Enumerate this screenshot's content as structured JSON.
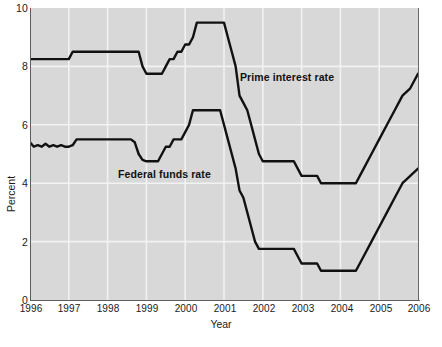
{
  "chart_data": {
    "type": "line",
    "title": "",
    "xlabel": "Year",
    "ylabel": "Percent",
    "xlim": [
      1996,
      2006
    ],
    "ylim": [
      0,
      10
    ],
    "grid": true,
    "legend_position": "inline-annotations",
    "xticks": [
      "1996",
      "1997",
      "1998",
      "1999",
      "2000",
      "2001",
      "2002",
      "2003",
      "2004",
      "2005",
      "2006"
    ],
    "yticks": [
      "0",
      "2",
      "4",
      "6",
      "8",
      "10"
    ],
    "series": [
      {
        "name": "Prime interest rate",
        "x": [
          1996.0,
          1996.1,
          1996.2,
          1996.3,
          1996.4,
          1996.5,
          1996.6,
          1996.7,
          1996.8,
          1996.9,
          1997.0,
          1997.1,
          1997.2,
          1997.3,
          1997.4,
          1997.5,
          1997.6,
          1997.7,
          1997.8,
          1997.9,
          1998.0,
          1998.1,
          1998.2,
          1998.3,
          1998.4,
          1998.5,
          1998.6,
          1998.7,
          1998.8,
          1998.9,
          1999.0,
          1999.1,
          1999.2,
          1999.3,
          1999.4,
          1999.5,
          1999.6,
          1999.7,
          1999.8,
          1999.9,
          2000.0,
          2000.1,
          2000.2,
          2000.3,
          2000.4,
          2000.5,
          2000.6,
          2000.7,
          2000.8,
          2000.9,
          2001.0,
          2001.1,
          2001.2,
          2001.3,
          2001.4,
          2001.5,
          2001.6,
          2001.7,
          2001.8,
          2001.9,
          2002.0,
          2002.2,
          2002.4,
          2002.6,
          2002.8,
          2002.9,
          2003.0,
          2003.2,
          2003.4,
          2003.5,
          2003.7,
          2003.9,
          2004.0,
          2004.2,
          2004.4,
          2004.5,
          2004.6,
          2004.8,
          2005.0,
          2005.2,
          2005.4,
          2005.6,
          2005.8,
          2006.0
        ],
        "y": [
          8.25,
          8.25,
          8.25,
          8.25,
          8.25,
          8.25,
          8.25,
          8.25,
          8.25,
          8.25,
          8.25,
          8.5,
          8.5,
          8.5,
          8.5,
          8.5,
          8.5,
          8.5,
          8.5,
          8.5,
          8.5,
          8.5,
          8.5,
          8.5,
          8.5,
          8.5,
          8.5,
          8.5,
          8.5,
          8.0,
          7.75,
          7.75,
          7.75,
          7.75,
          7.75,
          8.0,
          8.25,
          8.25,
          8.5,
          8.5,
          8.75,
          8.75,
          9.0,
          9.5,
          9.5,
          9.5,
          9.5,
          9.5,
          9.5,
          9.5,
          9.5,
          9.0,
          8.5,
          8.0,
          7.0,
          6.75,
          6.5,
          6.0,
          5.5,
          5.0,
          4.75,
          4.75,
          4.75,
          4.75,
          4.75,
          4.5,
          4.25,
          4.25,
          4.25,
          4.0,
          4.0,
          4.0,
          4.0,
          4.0,
          4.0,
          4.25,
          4.5,
          5.0,
          5.5,
          6.0,
          6.5,
          7.0,
          7.25,
          7.75
        ],
        "color": "#111111",
        "linewidth": 2.4,
        "annotation": "Prime interest rate"
      },
      {
        "name": "Federal funds rate",
        "x": [
          1996.0,
          1996.1,
          1996.2,
          1996.3,
          1996.4,
          1996.5,
          1996.6,
          1996.7,
          1996.8,
          1996.9,
          1997.0,
          1997.1,
          1997.2,
          1997.3,
          1997.4,
          1997.5,
          1997.6,
          1997.7,
          1997.8,
          1997.9,
          1998.0,
          1998.1,
          1998.2,
          1998.3,
          1998.4,
          1998.5,
          1998.6,
          1998.7,
          1998.8,
          1998.9,
          1999.0,
          1999.1,
          1999.2,
          1999.3,
          1999.4,
          1999.5,
          1999.6,
          1999.7,
          1999.8,
          1999.9,
          2000.0,
          2000.1,
          2000.2,
          2000.3,
          2000.4,
          2000.5,
          2000.6,
          2000.7,
          2000.8,
          2000.9,
          2001.0,
          2001.1,
          2001.2,
          2001.3,
          2001.4,
          2001.5,
          2001.6,
          2001.7,
          2001.8,
          2001.9,
          2002.0,
          2002.2,
          2002.4,
          2002.6,
          2002.8,
          2002.9,
          2003.0,
          2003.2,
          2003.4,
          2003.5,
          2003.7,
          2003.9,
          2004.0,
          2004.2,
          2004.4,
          2004.5,
          2004.6,
          2004.8,
          2005.0,
          2005.2,
          2005.4,
          2005.6,
          2005.8,
          2006.0
        ],
        "y": [
          5.4,
          5.25,
          5.3,
          5.25,
          5.35,
          5.25,
          5.3,
          5.25,
          5.3,
          5.25,
          5.25,
          5.3,
          5.5,
          5.5,
          5.5,
          5.5,
          5.5,
          5.5,
          5.5,
          5.5,
          5.5,
          5.5,
          5.5,
          5.5,
          5.5,
          5.5,
          5.5,
          5.4,
          5.0,
          4.8,
          4.75,
          4.75,
          4.75,
          4.75,
          5.0,
          5.25,
          5.25,
          5.5,
          5.5,
          5.5,
          5.75,
          6.0,
          6.5,
          6.5,
          6.5,
          6.5,
          6.5,
          6.5,
          6.5,
          6.5,
          6.0,
          5.5,
          5.0,
          4.5,
          3.75,
          3.5,
          3.0,
          2.5,
          2.0,
          1.75,
          1.75,
          1.75,
          1.75,
          1.75,
          1.75,
          1.5,
          1.25,
          1.25,
          1.25,
          1.0,
          1.0,
          1.0,
          1.0,
          1.0,
          1.0,
          1.25,
          1.5,
          2.0,
          2.5,
          3.0,
          3.5,
          4.0,
          4.25,
          4.5
        ],
        "color": "#111111",
        "linewidth": 2.4,
        "annotation": "Federal funds rate"
      }
    ]
  },
  "axes": {
    "ylabel": "Percent",
    "xlabel": "Year",
    "yticks": [
      "10",
      "8",
      "6",
      "4",
      "2",
      "0"
    ],
    "xticks": [
      "1996",
      "1997",
      "1998",
      "1999",
      "2000",
      "2001",
      "2002",
      "2003",
      "2004",
      "2005",
      "2006"
    ]
  },
  "annotations": {
    "prime": "Prime interest rate",
    "federal_funds": "Federal funds rate"
  },
  "caption": {
    "text": ""
  },
  "colors": {
    "plot_background": "#d8d8d8",
    "gridline": "#f0f0f0",
    "line": "#111111",
    "axis": "#5d5d5d",
    "text": "#1a1a1a"
  }
}
